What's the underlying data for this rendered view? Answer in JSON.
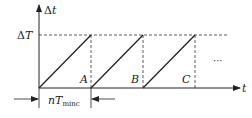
{
  "diagram": {
    "y_axis_label_delta": "Δ",
    "y_axis_label_var": "t",
    "x_axis_label": "t",
    "level_label_delta": "Δ",
    "level_label_var": "T",
    "points": [
      "A",
      "B",
      "C"
    ],
    "ellipsis": "···",
    "period_n": "n",
    "period_T": "T",
    "period_sub": "minc",
    "line_color": "#222222"
  }
}
